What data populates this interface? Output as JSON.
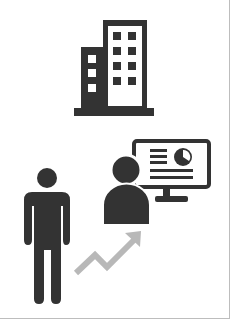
{
  "illustration": {
    "description": "Business growth concept icons",
    "icons": [
      {
        "id": "building",
        "semantic": "office-building-icon"
      },
      {
        "id": "person",
        "semantic": "standing-person-icon"
      },
      {
        "id": "growth_arrow",
        "semantic": "trend-up-arrow-icon"
      },
      {
        "id": "presenter",
        "semantic": "presenter-with-monitor-icon"
      },
      {
        "id": "pie_chart",
        "semantic": "pie-chart-icon"
      }
    ]
  },
  "colors": {
    "icon_dark": "#333333",
    "arrow_gray": "#b8b8b8",
    "border": "#bdbdbd",
    "background": "#ffffff"
  }
}
